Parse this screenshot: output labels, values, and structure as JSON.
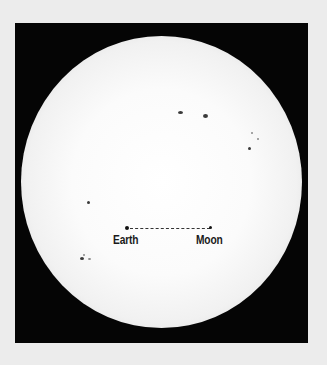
{
  "image": {
    "subject": "Sun disc with sunspots and Earth–Moon distance scale",
    "colors": {
      "page_background": "#ececec",
      "frame": "#050505",
      "sun": "#ffffff",
      "sunspot": "#3a3a3a",
      "label": "#1a1a1a"
    }
  },
  "scale": {
    "earth_label": "Earth",
    "moon_label": "Moon"
  },
  "sunspots": [
    {
      "x": 180,
      "y": 112,
      "w": 5,
      "h": 3
    },
    {
      "x": 205,
      "y": 116,
      "w": 5,
      "h": 4
    },
    {
      "x": 252,
      "y": 133,
      "w": 2,
      "h": 2,
      "faint": true
    },
    {
      "x": 258,
      "y": 139,
      "w": 2,
      "h": 2,
      "faint": true
    },
    {
      "x": 249,
      "y": 148,
      "w": 3,
      "h": 3
    },
    {
      "x": 88,
      "y": 202,
      "w": 3,
      "h": 3
    },
    {
      "x": 82,
      "y": 258,
      "w": 4,
      "h": 3
    },
    {
      "x": 89,
      "y": 259,
      "w": 3,
      "h": 2,
      "faint": true
    },
    {
      "x": 84,
      "y": 255,
      "w": 2,
      "h": 2,
      "faint": true
    }
  ]
}
